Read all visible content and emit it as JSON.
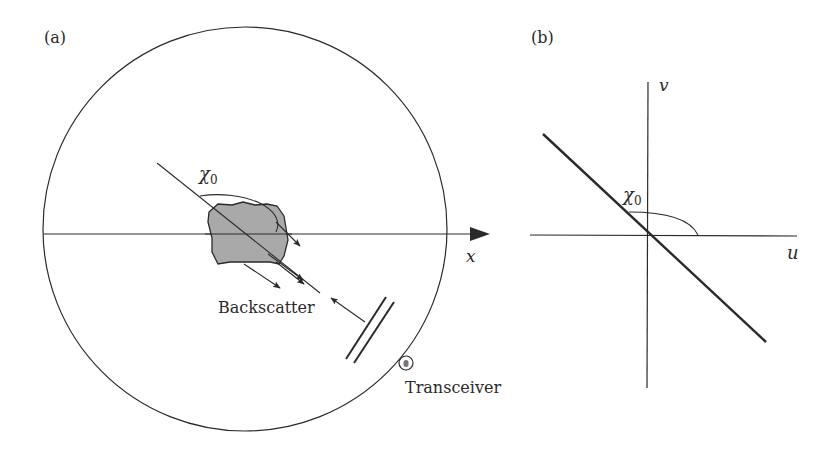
{
  "panel_a": {
    "label": "(a)",
    "angle_label": "χ",
    "angle_subscript": "0",
    "axis_label": "x",
    "backscatter_label": "Backscatter",
    "transceiver_label": "Transceiver"
  },
  "panel_b": {
    "label": "(b)",
    "angle_label": "χ",
    "angle_subscript": "0",
    "u_axis_label": "u",
    "v_axis_label": "v"
  },
  "colors": {
    "line": "#2a2a2a",
    "target_fill": "#a9a9a9"
  }
}
